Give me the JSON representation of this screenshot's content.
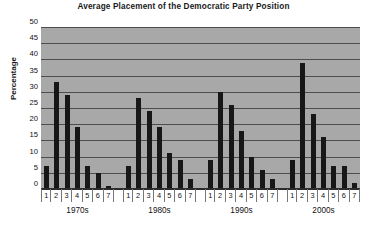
{
  "chart_data": {
    "type": "bar",
    "title": "Average Placement of the Democratic Party Position",
    "xlabel": "",
    "ylabel": "Percentage",
    "ylim": [
      0,
      50
    ],
    "ytick_step": 5,
    "yticks": [
      "50",
      "45",
      "40",
      "35",
      "30",
      "25",
      "20",
      "15",
      "10",
      "5",
      "0"
    ],
    "grid": true,
    "legend": "none",
    "categories": [
      "1",
      "2",
      "3",
      "4",
      "5",
      "6",
      "7"
    ],
    "groups": [
      {
        "label": "1970s",
        "categories": [
          "1",
          "2",
          "3",
          "4",
          "5",
          "6",
          "7"
        ],
        "values": [
          7,
          33,
          29,
          19,
          7,
          5,
          1
        ]
      },
      {
        "label": "1980s",
        "categories": [
          "1",
          "2",
          "3",
          "4",
          "5",
          "6",
          "7"
        ],
        "values": [
          7,
          28,
          24,
          19,
          11,
          9,
          3
        ]
      },
      {
        "label": "1990s",
        "categories": [
          "1",
          "2",
          "3",
          "4",
          "5",
          "6",
          "7"
        ],
        "values": [
          9,
          30,
          26,
          18,
          10,
          6,
          3
        ]
      },
      {
        "label": "2000s",
        "categories": [
          "1",
          "2",
          "3",
          "4",
          "5",
          "6",
          "7"
        ],
        "values": [
          9,
          39,
          23,
          16,
          7,
          7,
          2
        ]
      }
    ],
    "colors": {
      "bar": "#171717",
      "plot_background": "#a8a8a8",
      "gridline": "#4d4d4d",
      "axis": "#2b2b2b",
      "text": "#111111",
      "figure_background": "#ffffff"
    }
  }
}
